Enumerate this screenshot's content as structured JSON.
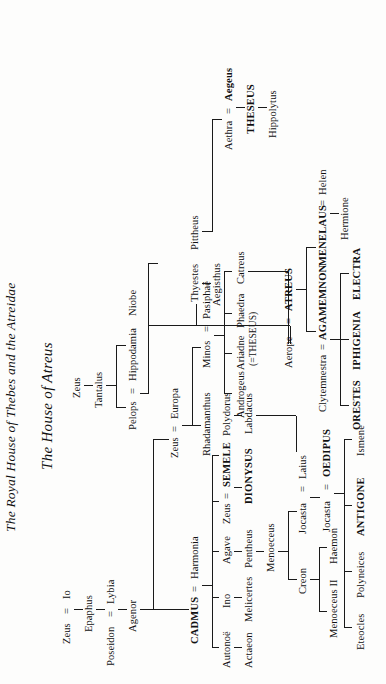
{
  "document": {
    "header_title": "The Royal House of Thebes and the Atreidae",
    "section_title": "The House of Atreus"
  },
  "people": {
    "zeus_top": "Zeus",
    "io": "Io",
    "epaphus": "Epaphus",
    "poseidon": "Poseidon",
    "lybia": "Lybia",
    "agenor": "Agenor",
    "cadmus": "CADMUS",
    "harmonia": "Harmonia",
    "autonoe": "Autonoë",
    "actaeon": "Actaeon",
    "ino": "Ino",
    "melicertes": "Melicertes",
    "agave": "Agave",
    "pentheus": "Pentheus",
    "zeus_semele": "Zeus",
    "semele": "SEMELE",
    "dionysus": "DIONYSUS",
    "polydorus": "Polydorus",
    "labdacus": "Labdacus",
    "menoeceus": "Menoeceus",
    "creon": "Creon",
    "jocasta1": "Jocasta",
    "laius": "Laius",
    "menoeceus2": "Menoeceus II",
    "haemon": "Haemon",
    "jocasta2": "Jocasta",
    "oedipus": "OEDIPUS",
    "eteocles": "Eteocles",
    "polyneices": "Polyneices",
    "antigone": "ANTIGONE",
    "ismene": "Ismene",
    "zeus_europa": "Zeus",
    "europa": "Europa",
    "rhadamanthus": "Rhadamanthus",
    "minos": "Minos",
    "pasiphae": "Pasiphaë",
    "androgeus": "Androgeus",
    "ariadne": "Ariadne",
    "phaedra": "Phaedra",
    "catreus": "Catreus",
    "theseus_note": "(=THESEUS)",
    "zeus_tantalus": "Zeus",
    "tantalus": "Tantalus",
    "pelops": "Pelops",
    "hippodamia": "Hippodamia",
    "niobe": "Niobe",
    "aerope": "Aerope",
    "atreus": "ATREUS",
    "thyestes": "Thyestes",
    "pittheus": "Pittheus",
    "aegisthus": "Aegisthus",
    "clytemnestra": "Clytemnestra",
    "agamemnon": "AGAMEMNON",
    "menelaus": "MENELAUS",
    "helen": "Helen",
    "hermione": "Hermione",
    "orestes": "ORESTES",
    "iphigenia": "IPHIGENIA",
    "electra": "ELECTRA",
    "aethra": "Aethra",
    "aegeus": "Aegeus",
    "theseus": "THESEUS",
    "hippolytus": "Hippolytus"
  },
  "symbols": {
    "marriage": "=",
    "equals_spaced": " = "
  }
}
